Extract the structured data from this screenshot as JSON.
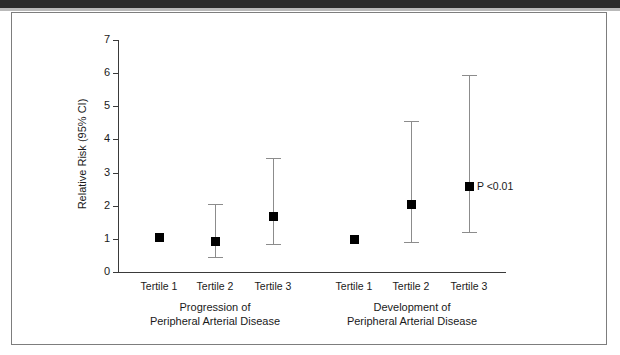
{
  "figure": {
    "y_axis_title": "Relative Risk (95% CI)",
    "y_ticks": [
      "0",
      "1",
      "2",
      "3",
      "4",
      "5",
      "6",
      "7"
    ],
    "annotation": "P <0.01",
    "group_labels": [
      {
        "line1": "Progression of",
        "line2": "Peripheral Arterial Disease"
      },
      {
        "line1": "Development of",
        "line2": "Peripheral Arterial Disease"
      }
    ],
    "category_labels": [
      "Tertile 1",
      "Tertile 2",
      "Tertile 3",
      "Tertile 1",
      "Tertile 2",
      "Tertile 3"
    ],
    "colors": {
      "marker": "#000000",
      "error_bar": "#8c8c8c",
      "axis": "#3a3a3a",
      "frame": "#7d7d7d",
      "text": "#1a1a1a"
    }
  },
  "chart_data": {
    "type": "scatter",
    "title": "",
    "subtitle": "",
    "xlabel": "",
    "ylabel": "Relative Risk (95% CI)",
    "ylim": [
      0,
      7
    ],
    "yticks": [
      0,
      1,
      2,
      3,
      4,
      5,
      6,
      7
    ],
    "grid": false,
    "legend": "none",
    "annotations": [
      {
        "text": "P <0.01",
        "attached_to": "Development of Peripheral Arterial Disease / Tertile 3"
      }
    ],
    "groups": [
      {
        "name": "Progression of Peripheral Arterial Disease",
        "categories": [
          "Tertile 1",
          "Tertile 2",
          "Tertile 3"
        ],
        "values": [
          1.05,
          0.95,
          1.7
        ],
        "ci_lower": [
          null,
          0.45,
          0.85
        ],
        "ci_upper": [
          null,
          2.05,
          3.45
        ]
      },
      {
        "name": "Development of Peripheral Arterial Disease",
        "categories": [
          "Tertile 1",
          "Tertile 2",
          "Tertile 3"
        ],
        "values": [
          1.0,
          2.05,
          2.6
        ],
        "ci_lower": [
          null,
          0.9,
          1.2
        ],
        "ci_upper": [
          null,
          4.55,
          5.95
        ]
      }
    ],
    "points": [
      {
        "group": "Progression of Peripheral Arterial Disease",
        "category": "Tertile 1",
        "value": 1.05,
        "ci_lower": null,
        "ci_upper": null
      },
      {
        "group": "Progression of Peripheral Arterial Disease",
        "category": "Tertile 2",
        "value": 0.95,
        "ci_lower": 0.45,
        "ci_upper": 2.05
      },
      {
        "group": "Progression of Peripheral Arterial Disease",
        "category": "Tertile 3",
        "value": 1.7,
        "ci_lower": 0.85,
        "ci_upper": 3.45
      },
      {
        "group": "Development of Peripheral Arterial Disease",
        "category": "Tertile 1",
        "value": 1.0,
        "ci_lower": null,
        "ci_upper": null
      },
      {
        "group": "Development of Peripheral Arterial Disease",
        "category": "Tertile 2",
        "value": 2.05,
        "ci_lower": 0.9,
        "ci_upper": 4.55
      },
      {
        "group": "Development of Peripheral Arterial Disease",
        "category": "Tertile 3",
        "value": 2.6,
        "ci_lower": 1.2,
        "ci_upper": 5.95
      }
    ]
  }
}
